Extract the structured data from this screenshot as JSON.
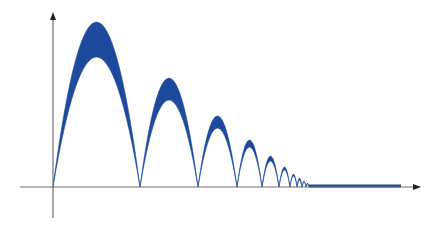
{
  "figure": {
    "colors": {
      "band": "#1d4a9c",
      "axis": "#6e6e6e",
      "background": "#ffffff"
    },
    "axes": {
      "x_axis": {
        "x_start": 20,
        "x_end": 421,
        "y": 187,
        "arrow": "right"
      },
      "y_axis": {
        "x": 53,
        "y_start": 218,
        "y_end": 12,
        "arrow": "up"
      }
    },
    "arches": [
      {
        "x0": 53,
        "x1": 140,
        "outer_top": 22,
        "inner_top": 57
      },
      {
        "x0": 140,
        "x1": 198,
        "outer_top": 78,
        "inner_top": 100
      },
      {
        "x0": 198,
        "x1": 237,
        "outer_top": 116,
        "inner_top": 128
      },
      {
        "x0": 237,
        "x1": 262,
        "outer_top": 140,
        "inner_top": 147
      },
      {
        "x0": 262,
        "x1": 279,
        "outer_top": 156,
        "inner_top": 161
      },
      {
        "x0": 279,
        "x1": 290,
        "outer_top": 167,
        "inner_top": 170
      },
      {
        "x0": 290,
        "x1": 297,
        "outer_top": 174,
        "inner_top": 176
      },
      {
        "x0": 297,
        "x1": 302,
        "outer_top": 178,
        "inner_top": 180
      },
      {
        "x0": 302,
        "x1": 306,
        "outer_top": 181,
        "inner_top": 182
      },
      {
        "x0": 306,
        "x1": 309,
        "outer_top": 183,
        "inner_top": 184
      }
    ],
    "settled_band": {
      "x0": 309,
      "x1": 401,
      "y_top": 184.5,
      "y_bottom": 187.5
    }
  }
}
